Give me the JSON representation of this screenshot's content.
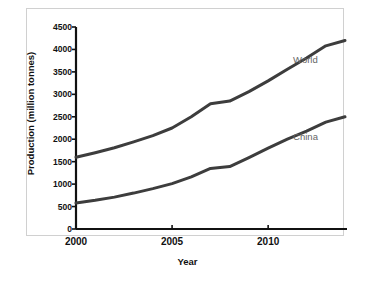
{
  "chart_data": {
    "type": "line",
    "title": "",
    "xlabel": "Year",
    "ylabel": "Production (million tonnes)",
    "xlim": [
      2000,
      2014
    ],
    "ylim": [
      0,
      4500
    ],
    "xticks": [
      "2000",
      "2005",
      "2010"
    ],
    "xtick_values": [
      2000,
      2005,
      2010
    ],
    "yticks": [
      "0",
      "500",
      "1000",
      "1500",
      "2000",
      "2500",
      "3000",
      "3500",
      "4000",
      "4500"
    ],
    "ytick_values": [
      0,
      500,
      1000,
      1500,
      2000,
      2500,
      3000,
      3500,
      4000,
      4500
    ],
    "grid": false,
    "legend_position": "inline-right",
    "x": [
      2000,
      2001,
      2002,
      2003,
      2004,
      2005,
      2006,
      2007,
      2008,
      2009,
      2010,
      2011,
      2012,
      2013,
      2014
    ],
    "series": [
      {
        "name": "World",
        "color": "#3d3d3d",
        "values": [
          1600,
          1700,
          1810,
          1940,
          2080,
          2250,
          2500,
          2790,
          2850,
          3060,
          3300,
          3560,
          3810,
          4080,
          4200
        ]
      },
      {
        "name": "China",
        "color": "#3d3d3d",
        "values": [
          580,
          640,
          710,
          800,
          900,
          1010,
          1160,
          1350,
          1390,
          1590,
          1800,
          2000,
          2180,
          2380,
          2500
        ]
      }
    ],
    "annotations": [
      {
        "text": "World",
        "x": 2011.3,
        "y": 3760
      },
      {
        "text": "China",
        "x": 2011.3,
        "y": 2060
      }
    ]
  },
  "colors": {
    "line": "#3d3d3d",
    "axis": "#111111",
    "frame": "#d0d0d0",
    "label_text": "#666666",
    "background": "#ffffff"
  }
}
